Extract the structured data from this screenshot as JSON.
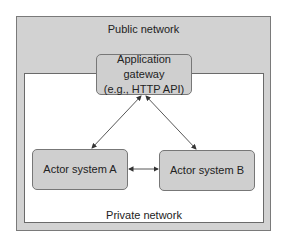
{
  "diagram": {
    "public_network": {
      "label": "Public network",
      "fill": "#d2d2d2"
    },
    "private_network": {
      "label": "Private network",
      "fill": "#ffffff"
    },
    "gateway": {
      "line1": "Application gateway",
      "line2": "(e.g., HTTP API)"
    },
    "actor_a": {
      "label": "Actor system A"
    },
    "actor_b": {
      "label": "Actor system B"
    },
    "edges": [
      {
        "from": "Application gateway",
        "to": "Actor system A",
        "bidirectional": true
      },
      {
        "from": "Application gateway",
        "to": "Actor system B",
        "bidirectional": true
      },
      {
        "from": "Actor system A",
        "to": "Actor system B",
        "bidirectional": true
      }
    ]
  }
}
